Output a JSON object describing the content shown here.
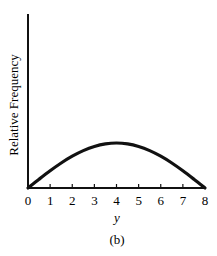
{
  "chart_data": {
    "type": "line",
    "title": "",
    "xlabel": "y",
    "ylabel": "Relative Frequency",
    "caption": "(b)",
    "x": [
      0,
      0.5,
      1,
      1.5,
      2,
      2.5,
      3,
      3.5,
      4,
      4.5,
      5,
      5.5,
      6,
      6.5,
      7,
      7.5,
      8
    ],
    "series": [
      {
        "name": "relative frequency",
        "values": [
          0,
          0.195,
          0.383,
          0.556,
          0.707,
          0.831,
          0.924,
          0.981,
          1,
          0.981,
          0.924,
          0.831,
          0.707,
          0.556,
          0.383,
          0.195,
          0
        ]
      }
    ],
    "xticks": [
      "0",
      "1",
      "2",
      "3",
      "4",
      "5",
      "6",
      "7",
      "8"
    ],
    "xlim": [
      0,
      8
    ],
    "ylim": [
      0,
      3.9
    ],
    "yticks": [],
    "grid": false,
    "legend": "none"
  },
  "labels": {
    "ylabel": "Relative Frequency",
    "xlabel": "y",
    "caption": "(b)"
  },
  "colors": {
    "line": "#111111",
    "axis": "#111111"
  }
}
